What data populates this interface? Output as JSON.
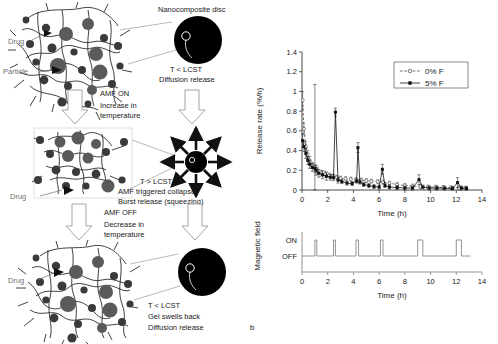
{
  "figure": {
    "panel_label_b": "b"
  },
  "diagram": {
    "labels": {
      "drug_top": "Drug",
      "particle": "Particle",
      "drug_mid": "Drug",
      "drug_bottom": "Drug",
      "nanocomposite_disc": "Nanocomposite disc"
    },
    "stage_top": {
      "condition": "T < LCST",
      "description": "Diffusion release"
    },
    "transition_on": {
      "heading": "AMF ON",
      "line1": "Increase in",
      "line2": "temperature"
    },
    "stage_mid": {
      "condition": "T > LCST",
      "line1": "AMF triggered collapse",
      "line2": "Burst release (squeezing)"
    },
    "transition_off": {
      "heading": "AMF OFF",
      "line1": "Decrease in",
      "line2": "temperature"
    },
    "stage_bottom": {
      "condition": "T < LCST",
      "line1": "Gel swells back",
      "line2": "Diffusion release"
    },
    "colors": {
      "disc": "#000000",
      "particle_large": "#5a5a5a",
      "particle_small": "#3a3a3a",
      "network": "#111111",
      "arrow_outline": "#8a8a8a",
      "leader": "#8f8f8f",
      "label_gray": "#6f6f6f"
    }
  },
  "chart_data": [
    {
      "type": "line",
      "id": "release-rate-chart",
      "title": "",
      "xlabel": "Time (h)",
      "ylabel": "Release rate (%/h)",
      "xlim": [
        0,
        14
      ],
      "ylim": [
        0,
        1.4
      ],
      "xticks": [
        0,
        2,
        4,
        6,
        8,
        10,
        12,
        14
      ],
      "yticks": [
        0,
        0.2,
        0.4,
        0.6,
        0.8,
        1,
        1.2,
        1.4
      ],
      "ytick_labels": [
        "0",
        "0.2",
        "0.4",
        "0.6",
        "0.8",
        "1",
        "1.2",
        "1.4"
      ],
      "grid": false,
      "legend_position": "top-right",
      "series": [
        {
          "name": "0% F",
          "marker": "open-circle",
          "linestyle": "dashed",
          "color": "#444444",
          "x": [
            0.05,
            0.15,
            0.3,
            0.45,
            0.6,
            0.8,
            1.0,
            1.2,
            1.5,
            1.8,
            2.1,
            2.4,
            2.7,
            3.0,
            3.4,
            3.8,
            4.2,
            4.6,
            5.0,
            5.4,
            5.9,
            6.3,
            6.8,
            7.4,
            8.0,
            8.6,
            9.2,
            9.8,
            10.4,
            11.0,
            11.6,
            12.2,
            12.7
          ],
          "y": [
            0.91,
            0.62,
            0.44,
            0.36,
            0.3,
            0.25,
            0.22,
            0.2,
            0.17,
            0.16,
            0.15,
            0.14,
            0.13,
            0.12,
            0.115,
            0.11,
            0.105,
            0.1,
            0.095,
            0.09,
            0.085,
            0.08,
            0.07,
            0.055,
            0.045,
            0.04,
            0.035,
            0.03,
            0.028,
            0.025,
            0.022,
            0.02,
            0.018
          ],
          "errors": [
            0.09,
            0.06,
            0.05,
            0.04,
            0.04,
            0.03,
            0.04,
            0.03,
            0.03,
            0.03,
            0.02,
            0.02,
            0.02,
            0.02,
            0.02,
            0.02,
            0.02,
            0.02,
            0.02,
            0.02,
            0.02,
            0.02,
            0.02,
            0.02,
            0.02,
            0.02,
            0.02,
            0.02,
            0.02,
            0.02,
            0.02,
            0.02,
            0.02
          ]
        },
        {
          "name": "5% F",
          "marker": "filled-square",
          "linestyle": "solid",
          "color": "#111111",
          "x": [
            0.05,
            0.15,
            0.3,
            0.45,
            0.6,
            0.8,
            1.0,
            1.1,
            1.3,
            1.6,
            1.9,
            2.2,
            2.45,
            2.6,
            2.8,
            3.1,
            3.5,
            3.9,
            4.25,
            4.35,
            4.5,
            4.8,
            5.2,
            5.6,
            6.0,
            6.25,
            6.45,
            6.8,
            7.4,
            8.0,
            8.6,
            9.1,
            9.4,
            9.9,
            10.5,
            11.1,
            11.7,
            12.1,
            12.4,
            12.8
          ],
          "y": [
            0.5,
            0.44,
            0.37,
            0.3,
            0.26,
            0.23,
            0.22,
            0.2,
            0.17,
            0.155,
            0.14,
            0.13,
            0.125,
            0.79,
            0.1,
            0.085,
            0.07,
            0.065,
            0.09,
            0.43,
            0.08,
            0.055,
            0.045,
            0.035,
            0.03,
            0.21,
            0.045,
            0.03,
            0.025,
            0.02,
            0.02,
            0.105,
            0.03,
            0.02,
            0.02,
            0.018,
            0.015,
            0.075,
            0.02,
            0.015
          ],
          "errors": [
            0.07,
            0.05,
            0.05,
            0.04,
            0.04,
            0.04,
            0.85,
            0.05,
            0.04,
            0.04,
            0.04,
            0.03,
            0.03,
            0.04,
            0.03,
            0.02,
            0.02,
            0.02,
            0.02,
            0.05,
            0.02,
            0.02,
            0.02,
            0.02,
            0.02,
            0.05,
            0.02,
            0.02,
            0.02,
            0.02,
            0.02,
            0.05,
            0.02,
            0.02,
            0.02,
            0.02,
            0.02,
            0.05,
            0.02,
            0.02
          ]
        }
      ],
      "annotations": [
        {
          "text": "burst spike",
          "x": 2.6,
          "y": 0.79
        },
        {
          "text": "burst spike",
          "x": 4.35,
          "y": 0.43
        },
        {
          "text": "burst spike",
          "x": 6.25,
          "y": 0.21
        },
        {
          "text": "burst spike",
          "x": 9.1,
          "y": 0.105
        },
        {
          "text": "burst spike",
          "x": 12.1,
          "y": 0.075
        }
      ]
    },
    {
      "type": "line",
      "id": "magnetic-field-chart",
      "title": "",
      "xlabel": "Time (h)",
      "ylabel": "Magnetic field",
      "xlim": [
        0,
        14
      ],
      "ylim": [
        0,
        1
      ],
      "xticks": [
        0,
        2,
        4,
        6,
        8,
        10,
        12,
        14
      ],
      "ytick_labels": [
        "ON",
        "OFF"
      ],
      "grid": false,
      "pulses": [
        {
          "start": 1.0,
          "end": 1.15,
          "state": "ON"
        },
        {
          "start": 2.45,
          "end": 2.6,
          "state": "ON"
        },
        {
          "start": 4.2,
          "end": 4.4,
          "state": "ON"
        },
        {
          "start": 6.1,
          "end": 6.3,
          "state": "ON"
        },
        {
          "start": 9.0,
          "end": 9.4,
          "state": "ON"
        },
        {
          "start": 12.0,
          "end": 12.4,
          "state": "ON"
        },
        {
          "start": 12.4,
          "end": 13.1,
          "state": "OFF"
        }
      ],
      "baseline_state": "OFF",
      "series": [
        {
          "name": "Magnetic field state",
          "color": "#888888",
          "linestyle": "solid"
        }
      ]
    }
  ]
}
